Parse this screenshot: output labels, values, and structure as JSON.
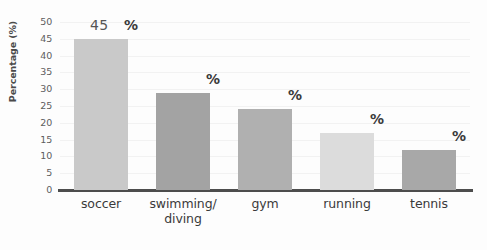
{
  "chart_data": {
    "type": "bar",
    "title": "",
    "subtitle": "",
    "xlabel": "",
    "ylabel": "Percentage (%)",
    "ylim": [
      0,
      50
    ],
    "ytick_step": 5,
    "yticks": [
      50,
      45,
      40,
      35,
      30,
      25,
      20,
      15,
      10,
      5,
      0
    ],
    "grid": true,
    "grid_axis": "y",
    "legend": false,
    "legend_position": "none",
    "categories": [
      "soccer",
      "swimming/diving",
      "gym",
      "running",
      "tennis"
    ],
    "category_lines": [
      [
        "soccer"
      ],
      [
        "swimming/",
        "diving"
      ],
      [
        "gym"
      ],
      [
        "running"
      ],
      [
        "tennis"
      ]
    ],
    "values": [
      45,
      29,
      24,
      17,
      12
    ],
    "value_labels": [
      "45",
      "",
      "",
      "",
      ""
    ],
    "unit_labels": [
      "%",
      "%",
      "%",
      "%",
      "%"
    ],
    "bar_colors": [
      "#c9c9c9",
      "#a3a3a3",
      "#b0b0b0",
      "#dcdcdc",
      "#a8a8a8"
    ],
    "background_color": "#fdfdfd",
    "axis_color": "#4d4d4d",
    "gridline_color": "#f2f2f2",
    "tick_label_color": "#5d5d5d"
  }
}
